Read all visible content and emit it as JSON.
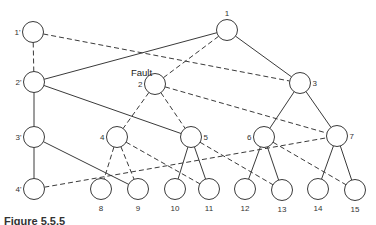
{
  "diagram": {
    "fault_label": "Fault",
    "nodes": [
      {
        "id": "1'",
        "x": 33,
        "y": 32,
        "label_side": "left"
      },
      {
        "id": "2'",
        "x": 34,
        "y": 82,
        "label_side": "left"
      },
      {
        "id": "3'",
        "x": 34,
        "y": 137,
        "label_side": "left"
      },
      {
        "id": "4'",
        "x": 34,
        "y": 189,
        "label_side": "left"
      },
      {
        "id": "1",
        "x": 227,
        "y": 30,
        "label_side": "top"
      },
      {
        "id": "2",
        "x": 155,
        "y": 84,
        "label_side": "left"
      },
      {
        "id": "3",
        "x": 300,
        "y": 83,
        "label_side": "right"
      },
      {
        "id": "4",
        "x": 117,
        "y": 137,
        "label_side": "left"
      },
      {
        "id": "5",
        "x": 191,
        "y": 137,
        "label_side": "right"
      },
      {
        "id": "6",
        "x": 264,
        "y": 137,
        "label_side": "left"
      },
      {
        "id": "7",
        "x": 337,
        "y": 136,
        "label_side": "right"
      },
      {
        "id": "8",
        "x": 101,
        "y": 189,
        "label_side": "bottom"
      },
      {
        "id": "9",
        "x": 138,
        "y": 189,
        "label_side": "bottom"
      },
      {
        "id": "10",
        "x": 175,
        "y": 189,
        "label_side": "bottom"
      },
      {
        "id": "11",
        "x": 209,
        "y": 189,
        "label_side": "bottom"
      },
      {
        "id": "12",
        "x": 245,
        "y": 189,
        "label_side": "bottom"
      },
      {
        "id": "13",
        "x": 282,
        "y": 190,
        "label_side": "bottom"
      },
      {
        "id": "14",
        "x": 318,
        "y": 189,
        "label_side": "bottom"
      },
      {
        "id": "15",
        "x": 355,
        "y": 190,
        "label_side": "bottom"
      }
    ],
    "edges": [
      {
        "from": "1'",
        "to": "2'",
        "style": "dashed"
      },
      {
        "from": "1'",
        "to": "3",
        "style": "dashed"
      },
      {
        "from": "2'",
        "to": "1",
        "style": "solid"
      },
      {
        "from": "2'",
        "to": "3'",
        "style": "solid"
      },
      {
        "from": "2'",
        "to": "5",
        "style": "solid"
      },
      {
        "from": "3'",
        "to": "4'",
        "style": "solid"
      },
      {
        "from": "3'",
        "to": "9",
        "style": "solid"
      },
      {
        "from": "4'",
        "to": "7",
        "style": "dashed"
      },
      {
        "from": "1",
        "to": "2",
        "style": "dashed"
      },
      {
        "from": "1",
        "to": "3",
        "style": "solid"
      },
      {
        "from": "2",
        "to": "4",
        "style": "dashed"
      },
      {
        "from": "2",
        "to": "5",
        "style": "dashed"
      },
      {
        "from": "2",
        "to": "7",
        "style": "dashed"
      },
      {
        "from": "3",
        "to": "6",
        "style": "solid"
      },
      {
        "from": "3",
        "to": "7",
        "style": "solid"
      },
      {
        "from": "4",
        "to": "8",
        "style": "dashed"
      },
      {
        "from": "4",
        "to": "9",
        "style": "dashed"
      },
      {
        "from": "4",
        "to": "11",
        "style": "dashed"
      },
      {
        "from": "5",
        "to": "10",
        "style": "solid"
      },
      {
        "from": "5",
        "to": "11",
        "style": "solid"
      },
      {
        "from": "5",
        "to": "13",
        "style": "dashed"
      },
      {
        "from": "6",
        "to": "12",
        "style": "solid"
      },
      {
        "from": "6",
        "to": "13",
        "style": "solid"
      },
      {
        "from": "6",
        "to": "15",
        "style": "dashed"
      },
      {
        "from": "7",
        "to": "14",
        "style": "solid"
      },
      {
        "from": "7",
        "to": "15",
        "style": "solid"
      }
    ]
  },
  "caption": {
    "label": "Figure 5.5.5",
    "text": "Case of a fault (clipped caption)"
  }
}
